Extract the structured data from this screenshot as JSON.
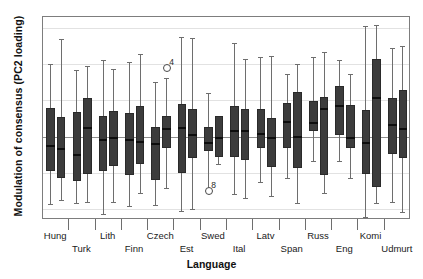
{
  "axes": {
    "ylabel": "Modulation of consensus (PC2 loading)",
    "xlabel": "Language",
    "yticks": [
      ".6",
      ".4",
      ".2",
      ".0",
      "-.2",
      "-.4"
    ]
  },
  "chart_data": {
    "type": "box",
    "title": "",
    "xlabel": "Language",
    "ylabel": "Modulation of consensus (PC2 loading)",
    "ylim": [
      -0.46,
      0.66
    ],
    "ytick_values": [
      0.6,
      0.4,
      0.2,
      0.0,
      -0.2,
      -0.4
    ],
    "grid": true,
    "legend": "none",
    "boxes_per_category": 2,
    "categories": [
      "Hung",
      "Turk",
      "Lith",
      "Finn",
      "Czech",
      "Est",
      "Swed",
      "Ital",
      "Latv",
      "Span",
      "Russ",
      "Eng",
      "Komi",
      "Udmurt"
    ],
    "boxes": [
      {
        "category": "Hung",
        "index": 0,
        "whisker_low": -0.37,
        "q1": -0.19,
        "median": -0.05,
        "q3": 0.16,
        "whisker_high": 0.4
      },
      {
        "category": "Hung",
        "index": 1,
        "whisker_low": -0.35,
        "q1": -0.23,
        "median": -0.07,
        "q3": 0.11,
        "whisker_high": 0.54
      },
      {
        "category": "Turk",
        "index": 0,
        "whisker_low": -0.365,
        "q1": -0.245,
        "median": -0.1,
        "q3": 0.135,
        "whisker_high": 0.37
      },
      {
        "category": "Turk",
        "index": 1,
        "whisker_low": -0.36,
        "q1": -0.205,
        "median": 0.05,
        "q3": 0.215,
        "whisker_high": 0.39
      },
      {
        "category": "Lith",
        "index": 0,
        "whisker_low": -0.425,
        "q1": -0.19,
        "median": -0.02,
        "q3": 0.115,
        "whisker_high": 0.425
      },
      {
        "category": "Lith",
        "index": 1,
        "whisker_low": -0.36,
        "q1": -0.16,
        "median": -0.005,
        "q3": 0.14,
        "whisker_high": 0.375
      },
      {
        "category": "Finn",
        "index": 0,
        "whisker_low": -0.385,
        "q1": -0.21,
        "median": -0.02,
        "q3": 0.13,
        "whisker_high": 0.41
      },
      {
        "category": "Finn",
        "index": 1,
        "whisker_low": -0.31,
        "q1": -0.15,
        "median": -0.03,
        "q3": 0.17,
        "whisker_high": 0.455
      },
      {
        "category": "Czech",
        "index": 0,
        "whisker_low": -0.375,
        "q1": -0.24,
        "median": -0.04,
        "q3": 0.055,
        "whisker_high": 0.3
      },
      {
        "category": "Czech",
        "index": 1,
        "whisker_low": -0.285,
        "q1": -0.065,
        "median": 0.04,
        "q3": 0.115,
        "whisker_high": 0.325
      },
      {
        "category": "Est",
        "index": 0,
        "whisker_low": -0.41,
        "q1": -0.2,
        "median": 0.045,
        "q3": 0.18,
        "whisker_high": 0.55
      },
      {
        "category": "Est",
        "index": 1,
        "whisker_low": -0.4,
        "q1": -0.12,
        "median": 0.01,
        "q3": 0.15,
        "whisker_high": 0.545
      },
      {
        "category": "Swed",
        "index": 0,
        "whisker_low": -0.305,
        "q1": -0.08,
        "median": -0.035,
        "q3": 0.055,
        "whisker_high": 0.24
      },
      {
        "category": "Swed",
        "index": 1,
        "whisker_low": -0.15,
        "q1": -0.115,
        "median": -0.01,
        "q3": 0.115,
        "whisker_high": 0.115
      },
      {
        "category": "Ital",
        "index": 0,
        "whisker_low": -0.315,
        "q1": -0.11,
        "median": 0.03,
        "q3": 0.17,
        "whisker_high": 0.515
      },
      {
        "category": "Ital",
        "index": 1,
        "whisker_low": -0.34,
        "q1": -0.13,
        "median": 0.03,
        "q3": 0.155,
        "whisker_high": 0.43
      },
      {
        "category": "Latv",
        "index": 0,
        "whisker_low": -0.25,
        "q1": -0.065,
        "median": 0.015,
        "q3": 0.15,
        "whisker_high": 0.44
      },
      {
        "category": "Latv",
        "index": 1,
        "whisker_low": -0.325,
        "q1": -0.165,
        "median": -0.005,
        "q3": 0.105,
        "whisker_high": 0.445
      },
      {
        "category": "Span",
        "index": 0,
        "whisker_low": -0.23,
        "q1": -0.065,
        "median": 0.08,
        "q3": 0.185,
        "whisker_high": 0.345
      },
      {
        "category": "Span",
        "index": 1,
        "whisker_low": -0.365,
        "q1": -0.175,
        "median": 0.0,
        "q3": 0.245,
        "whisker_high": 0.4
      },
      {
        "category": "Russ",
        "index": 0,
        "whisker_low": -0.135,
        "q1": 0.03,
        "median": 0.075,
        "q3": 0.195,
        "whisker_high": 0.44
      },
      {
        "category": "Russ",
        "index": 1,
        "whisker_low": -0.31,
        "q1": -0.21,
        "median": 0.15,
        "q3": 0.22,
        "whisker_high": 0.465
      },
      {
        "category": "Eng",
        "index": 0,
        "whisker_low": -0.135,
        "q1": 0.01,
        "median": 0.17,
        "q3": 0.28,
        "whisker_high": 0.425
      },
      {
        "category": "Eng",
        "index": 1,
        "whisker_low": -0.23,
        "q1": -0.065,
        "median": -0.01,
        "q3": 0.175,
        "whisker_high": 0.345
      },
      {
        "category": "Komi",
        "index": 0,
        "whisker_low": -0.445,
        "q1": -0.205,
        "median": -0.035,
        "q3": 0.145,
        "whisker_high": 0.61
      },
      {
        "category": "Komi",
        "index": 1,
        "whisker_low": -0.365,
        "q1": -0.28,
        "median": 0.215,
        "q3": 0.43,
        "whisker_high": 0.615
      },
      {
        "category": "Udmurt",
        "index": 0,
        "whisker_low": -0.36,
        "q1": -0.095,
        "median": 0.065,
        "q3": 0.215,
        "whisker_high": 0.49
      },
      {
        "category": "Udmurt",
        "index": 1,
        "whisker_low": -0.415,
        "q1": -0.12,
        "median": 0.04,
        "q3": 0.255,
        "whisker_high": 0.5
      }
    ],
    "outliers": [
      {
        "category": "Czech",
        "index": 1,
        "value": 0.385,
        "label": "4"
      },
      {
        "category": "Swed",
        "index": 0,
        "value": -0.295,
        "label": "8"
      }
    ]
  }
}
